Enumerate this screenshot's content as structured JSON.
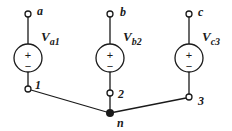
{
  "diagram": {
    "type": "three-phase wye-connected voltage sources",
    "colors": {
      "stroke": "#1a1a1a",
      "background": "#ffffff"
    },
    "sources": [
      {
        "id": "a",
        "terminal_label": "a",
        "source_label_main": "V",
        "source_label_sub": "a1",
        "bottom_node_label": "1",
        "plus": "+",
        "minus": "−"
      },
      {
        "id": "b",
        "terminal_label": "b",
        "source_label_main": "V",
        "source_label_sub": "b2",
        "bottom_node_label": "2",
        "plus": "+",
        "minus": "−"
      },
      {
        "id": "c",
        "terminal_label": "c",
        "source_label_main": "V",
        "source_label_sub": "c3",
        "bottom_node_label": "3",
        "plus": "+",
        "minus": "−"
      }
    ],
    "neutral_label": "n"
  }
}
